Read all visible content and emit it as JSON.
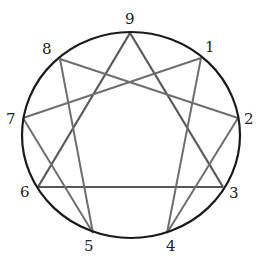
{
  "diagram": {
    "type": "enneagram",
    "circle": {
      "cx": 131,
      "cy": 135,
      "rx": 109,
      "ry": 103,
      "stroke": "#1a1a1a",
      "width": 2.2
    },
    "line_color": "#6e6e6e",
    "triangle_color": "#585858",
    "points": [
      {
        "id": "1",
        "x": 201,
        "y": 58,
        "lx": 205,
        "ly": 52
      },
      {
        "id": "2",
        "x": 238,
        "y": 118,
        "lx": 244,
        "ly": 124
      },
      {
        "id": "3",
        "x": 223,
        "y": 187,
        "lx": 229,
        "ly": 198
      },
      {
        "id": "4",
        "x": 167,
        "y": 233,
        "lx": 166,
        "ly": 251
      },
      {
        "id": "5",
        "x": 93,
        "y": 233,
        "lx": 84,
        "ly": 251
      },
      {
        "id": "6",
        "x": 38,
        "y": 187,
        "lx": 20,
        "ly": 197
      },
      {
        "id": "7",
        "x": 23,
        "y": 118,
        "lx": 6,
        "ly": 124
      },
      {
        "id": "8",
        "x": 60,
        "y": 59,
        "lx": 42,
        "ly": 54
      },
      {
        "id": "9",
        "x": 130,
        "y": 33,
        "lx": 125,
        "ly": 24
      }
    ],
    "triangle": [
      "9",
      "3",
      "6"
    ],
    "hexad": [
      "1",
      "4",
      "2",
      "8",
      "5",
      "7",
      "1"
    ]
  }
}
